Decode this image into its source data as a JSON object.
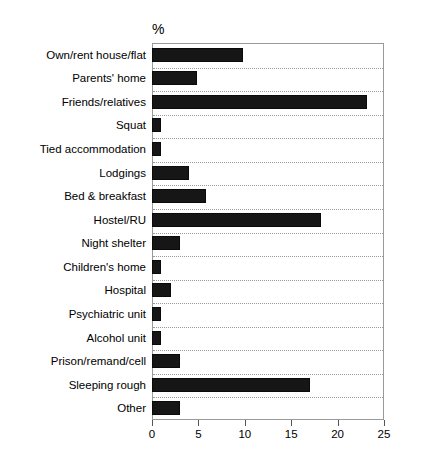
{
  "chart_data": {
    "type": "bar",
    "orientation": "horizontal",
    "title": "",
    "subtitle": "",
    "unit_label": "%",
    "xlabel": "",
    "ylabel": "",
    "xlim": [
      0,
      25
    ],
    "xticks": [
      0,
      5,
      10,
      15,
      20,
      25
    ],
    "xtick_labels": [
      "0",
      "5",
      "10",
      "15",
      "20",
      "25"
    ],
    "grid": "horizontal-dotted",
    "legend": "none",
    "bar_color": "#161616",
    "categories": [
      "Own/rent house/flat",
      "Parents' home",
      "Friends/relatives",
      "Squat",
      "Tied accommodation",
      "Lodgings",
      "Bed & breakfast",
      "Hostel/RU",
      "Night shelter",
      "Children's home",
      "Hospital",
      "Psychiatric unit",
      "Alcohol unit",
      "Prison/remand/cell",
      "Sleeping rough",
      "Other"
    ],
    "values": [
      9.8,
      4.9,
      23.2,
      1.0,
      1.0,
      4.0,
      5.8,
      18.2,
      3.0,
      1.0,
      2.0,
      1.0,
      1.0,
      3.0,
      17.0,
      3.0
    ]
  },
  "axis": {
    "unit_label": "%"
  }
}
